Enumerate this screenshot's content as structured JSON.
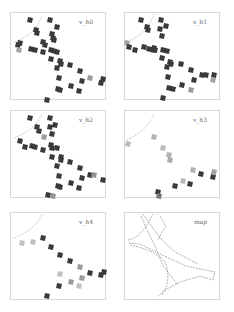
{
  "chart_data": [
    {
      "type": "scatter",
      "title": "v_h0",
      "marker": "square",
      "points": [
        [
          30,
          20,
          1
        ],
        [
          50,
          20,
          1
        ],
        [
          57,
          27,
          1
        ],
        [
          36,
          30,
          1
        ],
        [
          37,
          33,
          1
        ],
        [
          18,
          45,
          1
        ],
        [
          20,
          43,
          1
        ],
        [
          43,
          42,
          1
        ],
        [
          45,
          45,
          1
        ],
        [
          53,
          38,
          1
        ],
        [
          54,
          40,
          1
        ],
        [
          52,
          34,
          1
        ],
        [
          31,
          49,
          1
        ],
        [
          35,
          50,
          1
        ],
        [
          43,
          52,
          1
        ],
        [
          51,
          50,
          1
        ],
        [
          54,
          51,
          1
        ],
        [
          57,
          52,
          1
        ],
        [
          51,
          59,
          1
        ],
        [
          60,
          61,
          1
        ],
        [
          61,
          64,
          1
        ],
        [
          57,
          68,
          1
        ],
        [
          70,
          65,
          1
        ],
        [
          80,
          71,
          1
        ],
        [
          59,
          78,
          1
        ],
        [
          82,
          81,
          1
        ],
        [
          71,
          86,
          1
        ],
        [
          90,
          78,
          0.35
        ],
        [
          103,
          79,
          1
        ],
        [
          101,
          83,
          1
        ],
        [
          58,
          89,
          1
        ],
        [
          60,
          90,
          1
        ],
        [
          79,
          91,
          1
        ],
        [
          47,
          100,
          1
        ],
        [
          19,
          50,
          0.3
        ]
      ]
    },
    {
      "type": "scatter",
      "title": "v_h1",
      "marker": "square",
      "points": [
        [
          141,
          20,
          1
        ],
        [
          161,
          20,
          1
        ],
        [
          147,
          27,
          1
        ],
        [
          148,
          30,
          1
        ],
        [
          160,
          29,
          1
        ],
        [
          166,
          26,
          1
        ],
        [
          162,
          36,
          1
        ],
        [
          127,
          43,
          0.3
        ],
        [
          129,
          47,
          1
        ],
        [
          135,
          50,
          1
        ],
        [
          144,
          47,
          1
        ],
        [
          149,
          49,
          1
        ],
        [
          154,
          48,
          1
        ],
        [
          153,
          50,
          1
        ],
        [
          155,
          50,
          1
        ],
        [
          163,
          50,
          1
        ],
        [
          167,
          51,
          1
        ],
        [
          162,
          58,
          1
        ],
        [
          170,
          62,
          1
        ],
        [
          171,
          64,
          1
        ],
        [
          181,
          64,
          1
        ],
        [
          167,
          67,
          1
        ],
        [
          191,
          70,
          1
        ],
        [
          168,
          77,
          1
        ],
        [
          194,
          80,
          1
        ],
        [
          202,
          75,
          1
        ],
        [
          206,
          75,
          1
        ],
        [
          214,
          75,
          1
        ],
        [
          213,
          80,
          0.3
        ],
        [
          182,
          85,
          1
        ],
        [
          169,
          88,
          1
        ],
        [
          173,
          89,
          1
        ],
        [
          191,
          90,
          0.35
        ],
        [
          163,
          98,
          1
        ]
      ]
    },
    {
      "type": "scatter",
      "title": "v_h2",
      "marker": "square",
      "points": [
        [
          30,
          118,
          1
        ],
        [
          50,
          118,
          1
        ],
        [
          37,
          127,
          1
        ],
        [
          39,
          131,
          1
        ],
        [
          55,
          125,
          1
        ],
        [
          50,
          127,
          1
        ],
        [
          20,
          141,
          1
        ],
        [
          25,
          147,
          1
        ],
        [
          32,
          146,
          1
        ],
        [
          35,
          147,
          1
        ],
        [
          43,
          150,
          1
        ],
        [
          44,
          137,
          0.35
        ],
        [
          52,
          134,
          1
        ],
        [
          51,
          145,
          1
        ],
        [
          52,
          148,
          1
        ],
        [
          57,
          148,
          1
        ],
        [
          52,
          157,
          1
        ],
        [
          61,
          157,
          1
        ],
        [
          61,
          160,
          1
        ],
        [
          57,
          166,
          1
        ],
        [
          70,
          162,
          1
        ],
        [
          80,
          168,
          1
        ],
        [
          59,
          176,
          1
        ],
        [
          82,
          178,
          1
        ],
        [
          71,
          183,
          1
        ],
        [
          90,
          175,
          1
        ],
        [
          94,
          175,
          0.4
        ],
        [
          103,
          180,
          1
        ],
        [
          58,
          186,
          1
        ],
        [
          60,
          187,
          1
        ],
        [
          79,
          188,
          1
        ],
        [
          48,
          195,
          1
        ],
        [
          53,
          196,
          0.4
        ]
      ]
    },
    {
      "type": "scatter",
      "title": "v_h3",
      "marker": "square",
      "points": [
        [
          128,
          144,
          0.15
        ],
        [
          154,
          137,
          0.2
        ],
        [
          163,
          148,
          0.15
        ],
        [
          169,
          155,
          0.2
        ],
        [
          170,
          160,
          0.25
        ],
        [
          193,
          170,
          0.2
        ],
        [
          201,
          174,
          1
        ],
        [
          213,
          177,
          1
        ],
        [
          214,
          172,
          0.3
        ],
        [
          183,
          181,
          0.15
        ],
        [
          175,
          186,
          1
        ],
        [
          190,
          184,
          1
        ],
        [
          158,
          192,
          1
        ],
        [
          159,
          196,
          0.6
        ]
      ]
    },
    {
      "type": "scatter",
      "title": "v_h4",
      "marker": "square",
      "points": [
        [
          22,
          243,
          0.1
        ],
        [
          33,
          242,
          0.1
        ],
        [
          43,
          238,
          1
        ],
        [
          51,
          247,
          1
        ],
        [
          60,
          255,
          1
        ],
        [
          70,
          261,
          1
        ],
        [
          80,
          267,
          0.35
        ],
        [
          82,
          278,
          0.35
        ],
        [
          90,
          273,
          1
        ],
        [
          101,
          275,
          1
        ],
        [
          104,
          272,
          1
        ],
        [
          60,
          274,
          0.1
        ],
        [
          71,
          282,
          0.35
        ],
        [
          79,
          286,
          0.1
        ],
        [
          59,
          286,
          1
        ],
        [
          47,
          296,
          1
        ]
      ]
    },
    {
      "type": "line",
      "title": "map",
      "style": "dotted path with node markers",
      "paths": [
        "M141,216 L147,230 L155,246 L163,266 L178,285",
        "M143,214 L150,224 L160,238 L175,252 L198,264",
        "M160,216 L166,226 L162,232 L158,240",
        "M128,240 Q140,238 150,220 L153,214",
        "M129,243 L140,244 L160,254 L186,266 L215,272 L213,280 L200,276 L180,282 L165,290 L158,296",
        "M130,245 Q155,250 165,262 Q172,280 162,295"
      ]
    }
  ],
  "panels": [
    {
      "label": "v_h0"
    },
    {
      "label": "v_h1"
    },
    {
      "label": "v_h2"
    },
    {
      "label": "v_h3"
    },
    {
      "label": "v_h4"
    },
    {
      "label": "map"
    }
  ],
  "colors": {
    "marker": "#3a3a3a",
    "marker_faint": "#bdbdbd",
    "frame": "#d8d8d8",
    "dashed_arc": "#888888"
  }
}
